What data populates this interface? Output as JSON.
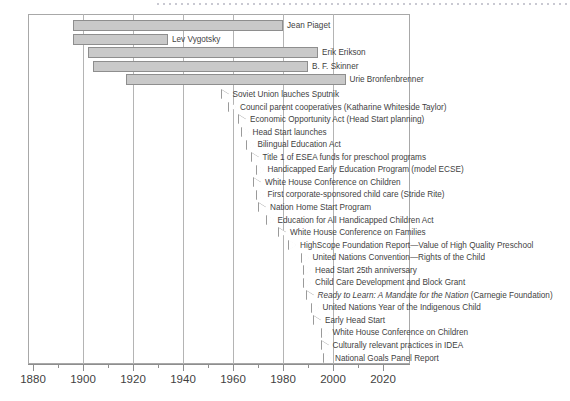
{
  "chart_data": {
    "type": "bar",
    "orientation": "horizontal-timeline",
    "title": "",
    "xlabel": "",
    "ylabel": "",
    "xlim": [
      1880,
      2020
    ],
    "grid": true,
    "legend": "none",
    "axis": {
      "major_ticks": [
        1880,
        1900,
        1920,
        1940,
        1960,
        1980,
        2000,
        2020
      ],
      "tick_labels": [
        "1880",
        "1900",
        "1920",
        "1940",
        "1960",
        "1980",
        "2000",
        "2020"
      ],
      "minor_ticks": [
        1890,
        1910,
        1930,
        1950,
        1970,
        1990,
        2010
      ],
      "gridlines": [
        1900,
        1920,
        1940,
        1960,
        1980,
        2000
      ]
    },
    "lifespan_bars": [
      {
        "name": "Jean Piaget",
        "start": 1896,
        "end": 1980,
        "label": "Jean Piaget"
      },
      {
        "name": "Lev Vygotsky",
        "start": 1896,
        "end": 1934,
        "label": "Lev Vygotsky"
      },
      {
        "name": "Erik Erikson",
        "start": 1902,
        "end": 1994,
        "label": "Erik Erikson"
      },
      {
        "name": "B. F. Skinner",
        "start": 1904,
        "end": 1990,
        "label": "B. F. Skinner"
      },
      {
        "name": "Urie Bronfenbrenner",
        "start": 1917,
        "end": 2005,
        "label": "Urie Bronfenbrenner"
      }
    ],
    "events": [
      {
        "year": 1957,
        "label": "Soviet Union lauches Sputnik",
        "italic": false
      },
      {
        "year": 1960,
        "label": "Council parent cooperatives (Katharine Whiteside Taylor)",
        "italic": false
      },
      {
        "year": 1964,
        "label": "Economic Opportunity Act (Head Start planning)",
        "italic": false
      },
      {
        "year": 1965,
        "label": "Head Start launches",
        "italic": false
      },
      {
        "year": 1967,
        "label": "Bilingual Education Act",
        "italic": false
      },
      {
        "year": 1969,
        "label": "Title 1 of ESEA funds for preschool programs",
        "italic": false
      },
      {
        "year": 1971,
        "label": "Handicapped Early Education Program (model ECSE)",
        "italic": false
      },
      {
        "year": 1970,
        "label": "White House Conference on Children",
        "italic": false
      },
      {
        "year": 1971,
        "label": "First corporate-sponsored child care (Stride Rite)",
        "italic": false
      },
      {
        "year": 1972,
        "label": "Nation Home Start Program",
        "italic": false
      },
      {
        "year": 1975,
        "label": "Education for All Handicapped Children Act",
        "italic": false
      },
      {
        "year": 1980,
        "label": "White House Conference on Families",
        "italic": false
      },
      {
        "year": 1984,
        "label": "HighScope Foundation Report—Value of High Quality Preschool",
        "italic": false
      },
      {
        "year": 1989,
        "label": "United Nations Convention—Rights of the Child",
        "italic": false
      },
      {
        "year": 1990,
        "label": "Head Start 25th anniversary",
        "italic": false
      },
      {
        "year": 1990,
        "label": "Child Care Development and Block Grant",
        "italic": false
      },
      {
        "year": 1991,
        "label": "Ready to Learn: A Mandate for the Nation (Carnegie Foundation)",
        "italic": true,
        "italic_part": "Ready to Learn: A Mandate for the Nation",
        "plain_part": " (Carnegie Foundation)"
      },
      {
        "year": 1993,
        "label": "United Nations Year of the Indigenous Child",
        "italic": false
      },
      {
        "year": 1994,
        "label": "Early Head Start",
        "italic": false
      },
      {
        "year": 1997,
        "label": "White House Conference on Children",
        "italic": false
      },
      {
        "year": 1997,
        "label": "Culturally relevant practices in IDEA",
        "italic": false
      },
      {
        "year": 1998,
        "label": "National Goals Panel Report",
        "italic": false
      }
    ],
    "colors": {
      "bar_fill": "#c9c9c9",
      "bar_border": "#8e8e8e",
      "marker_outline": "#9a9a9a",
      "axis": "#8e8e8e",
      "grid": "#b4b4b4",
      "text": "#3f3f3f"
    }
  },
  "caption": {
    "text": ""
  }
}
